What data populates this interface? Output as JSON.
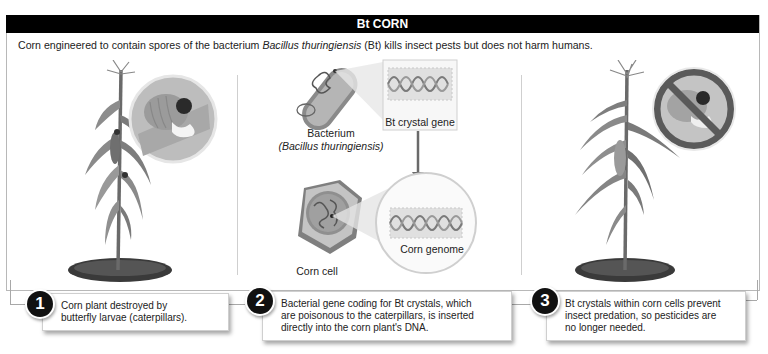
{
  "header": {
    "title": "Bt CORN",
    "subtitle_before": "Corn engineered to contain spores of the bacterium ",
    "subtitle_italic": "Bacillus thuringiensis",
    "subtitle_after": " (Bt) kills insect pests but does not harm humans."
  },
  "panels": [
    {
      "id": "panel-1",
      "illustration": "damaged-corn-plant",
      "inset": "caterpillar-eating-corn"
    },
    {
      "id": "panel-2",
      "labels": {
        "bacterium": "Bacterium",
        "bacterium_species": "(Bacillus thuringiensis)",
        "gene": "Bt crystal gene",
        "corn_cell": "Corn cell",
        "genome": "Corn genome"
      }
    },
    {
      "id": "panel-3",
      "illustration": "healthy-corn-plant",
      "inset": "no-caterpillar-prohibition-sign"
    }
  ],
  "steps": [
    {
      "number": "1",
      "text_line1": "Corn plant destroyed by",
      "text_line2": "butterfly larvae (caterpillars)."
    },
    {
      "number": "2",
      "text_line1": "Bacterial gene coding for Bt crystals, which",
      "text_line2": "are poisonous to the caterpillars, is inserted",
      "text_line3": "directly into the corn plant's DNA."
    },
    {
      "number": "3",
      "text_line1": "Bt crystals within corn cells prevent",
      "text_line2": "insect predation, so pesticides are",
      "text_line3": "no longer needed."
    }
  ],
  "colors": {
    "title_bar": "#000000",
    "title_text": "#ffffff",
    "badge": "#111111",
    "divider": "#cfcfcf",
    "plant_dark": "#555555",
    "plant_light": "#9a9a9a",
    "prohibition": "#555555",
    "dna": "#777777"
  }
}
